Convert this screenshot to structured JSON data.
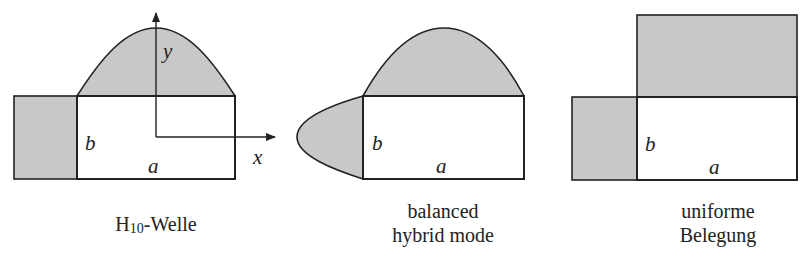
{
  "figure": {
    "heading_cut_off": "",
    "fill_color": "#c8c8c8",
    "stroke_color": "#222222",
    "panels": [
      {
        "id": "h10",
        "caption": {
          "main": "H",
          "subscript": "10",
          "suffix": "-Welle"
        },
        "labels": {
          "width": "a",
          "height": "b",
          "x_axis": "x",
          "y_axis": "y"
        },
        "top_distribution": "cosine half-wave",
        "side_distribution": "uniform"
      },
      {
        "id": "balanced-hybrid",
        "caption": {
          "line1": "balanced",
          "line2": "hybrid mode"
        },
        "labels": {
          "width": "a",
          "height": "b"
        },
        "top_distribution": "cosine half-wave",
        "side_distribution": "cosine half-wave"
      },
      {
        "id": "uniform",
        "caption": {
          "line1": "uniforme",
          "line2": "Belegung"
        },
        "labels": {
          "width": "a",
          "height": "b"
        },
        "top_distribution": "uniform",
        "side_distribution": "uniform"
      }
    ]
  }
}
